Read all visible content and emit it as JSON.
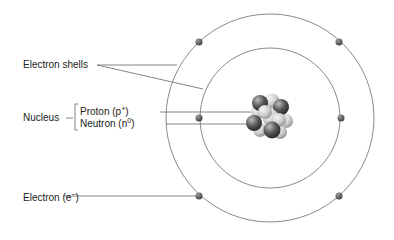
{
  "diagram": {
    "labels": {
      "electron_shells": "Electron shells",
      "nucleus": "Nucleus",
      "proton": "Proton (p",
      "proton_sup": "+",
      "proton_close": ")",
      "neutron": "Neutron (n",
      "neutron_sup": "0",
      "neutron_close": ")",
      "electron": "Electron (e",
      "electron_sup": "−",
      "electron_close": ")"
    },
    "colors": {
      "line": "#777777",
      "electron": "#555555",
      "proton_dark": "#4a4a4a",
      "neutron_light": "#d8d8d8"
    },
    "shells": [
      {
        "name": "inner",
        "radius": 70,
        "electrons": 2
      },
      {
        "name": "outer",
        "radius": 104,
        "electrons": 4
      }
    ]
  }
}
